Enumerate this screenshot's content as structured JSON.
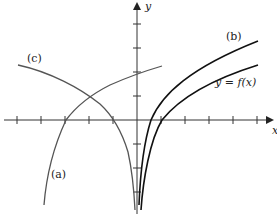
{
  "diagram": {
    "axes": {
      "x_label": "x",
      "y_label": "y",
      "origin_px": [
        137,
        120
      ],
      "unit_px": 24,
      "x_ticks": [
        -5,
        -4,
        -3,
        -2,
        -1,
        1,
        2,
        3,
        4,
        5
      ],
      "y_ticks": [
        -4,
        -3,
        -2,
        -1,
        1,
        2,
        3,
        4
      ]
    },
    "curves": [
      {
        "id": "f",
        "label": "y = f(x)",
        "description": "logarithmic curve, vertical asymptote at x=0, crosses x-axis at x=1"
      },
      {
        "id": "b",
        "label": "(b)",
        "description": "vertical stretch of f, crosses x-axis at x=0.5"
      },
      {
        "id": "a",
        "label": "(a)",
        "description": "reflected/shifted log curve rising from bottom-left, crosses x-axis at x=-3"
      },
      {
        "id": "c",
        "label": "(c)",
        "description": "reflection of f across y-axis, asymptote at x=0, crosses x-axis at x=-1"
      }
    ],
    "colors": {
      "axis": "#333333",
      "curve_dark": "#111111",
      "curve_gray": "#555555"
    }
  }
}
